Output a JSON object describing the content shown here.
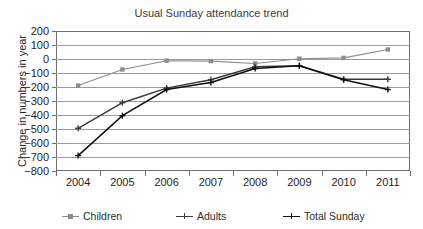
{
  "chart_data": {
    "type": "line",
    "title": "Usual Sunday attendance trend",
    "xlabel": "",
    "ylabel": "Change in numbers in year",
    "categories": [
      "2004",
      "2005",
      "2006",
      "2007",
      "2008",
      "2009",
      "2010",
      "2011"
    ],
    "ylim": [
      -800,
      200
    ],
    "yticks": [
      200,
      100,
      0,
      -100,
      -200,
      -300,
      -400,
      -500,
      -600,
      -700,
      -800
    ],
    "ytick_labels": [
      "200",
      "100",
      "0",
      "−100",
      "−200",
      "−300",
      "−400",
      "−500",
      "−600",
      "−700",
      "−800"
    ],
    "grid": true,
    "legend_position": "bottom",
    "series": [
      {
        "name": "Children",
        "color": "#8c8c8c",
        "marker": "square",
        "values": [
          -190,
          -75,
          -12,
          -15,
          -32,
          2,
          8,
          68
        ]
      },
      {
        "name": "Adults",
        "color": "#3a3a3a",
        "marker": "cross",
        "values": [
          -495,
          -312,
          -208,
          -148,
          -55,
          -48,
          -145,
          -145
        ]
      },
      {
        "name": "Total Sunday",
        "color": "#111111",
        "marker": "cross",
        "values": [
          -690,
          -405,
          -218,
          -168,
          -68,
          -48,
          -148,
          -218
        ]
      }
    ]
  }
}
